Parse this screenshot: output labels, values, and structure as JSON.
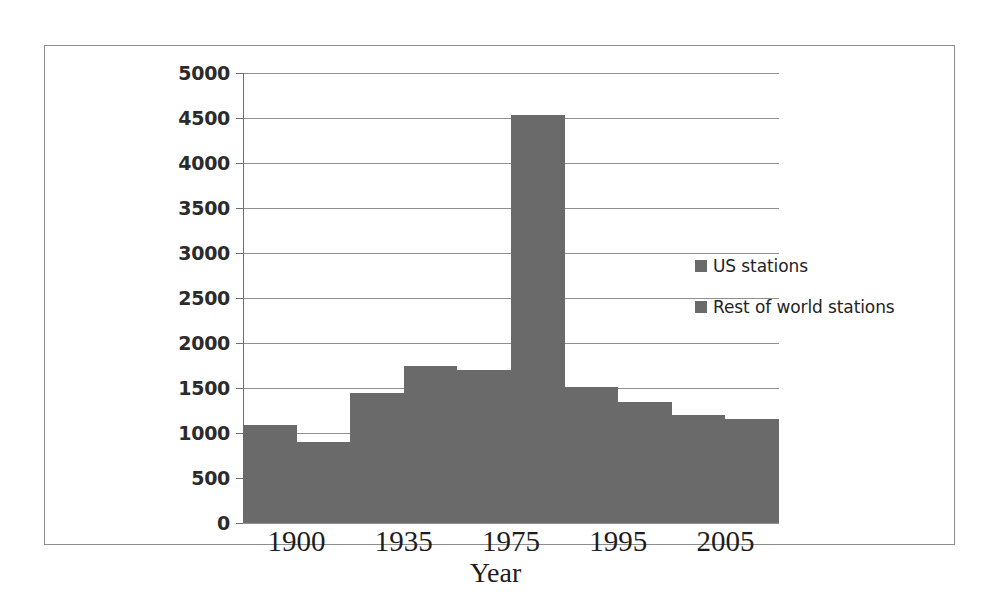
{
  "chart_data": {
    "type": "bar",
    "title": "",
    "subtitle": "",
    "xlabel": "Year",
    "ylabel": "",
    "categories": [
      "1900",
      "1935",
      "1975",
      "1995",
      "2005"
    ],
    "series": [
      {
        "name": "US stations",
        "color": "#6a6a6a",
        "values": [
          1090,
          1440,
          1700,
          1510,
          1200
        ]
      },
      {
        "name": "Rest of world stations",
        "color": "#6a6a6a",
        "values": [
          900,
          1750,
          4530,
          1340,
          1160
        ]
      }
    ],
    "ylim": [
      0,
      5000
    ],
    "ytick_values": [
      0,
      500,
      1000,
      1500,
      2000,
      2500,
      3000,
      3500,
      4000,
      4500,
      5000
    ],
    "ytick_labels": [
      "0",
      "500",
      "1000",
      "1500",
      "2000",
      "2500",
      "3000",
      "3500",
      "4000",
      "4500",
      "5000"
    ],
    "grid": true,
    "grid_axis": "y",
    "legend_position": "right-inside",
    "bar_gap_within_group": 0,
    "frame_border": true
  },
  "legend": {
    "items": [
      {
        "label": "US stations",
        "swatch_color": "#6a6a6a"
      },
      {
        "label": "Rest of world stations",
        "swatch_color": "#6a6a6a"
      }
    ]
  },
  "axis": {
    "x_title": "Year"
  },
  "colors": {
    "bar_fill": "#6a6a6a",
    "gridline": "#8f8f8f",
    "axis_line": "#6e6e6e",
    "frame_border": "#8d8d8d",
    "text": "#1d1d1d",
    "background": "#ffffff"
  }
}
